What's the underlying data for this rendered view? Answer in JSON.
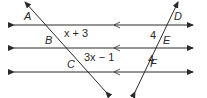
{
  "figure": {
    "points": {
      "A": "A",
      "B": "B",
      "C": "C",
      "D": "D",
      "E": "E",
      "F": "F"
    },
    "segments": {
      "AB_to_BC": "x + 3",
      "BC": "3x − 1",
      "DE": "4",
      "EF": "4"
    },
    "colors": {
      "line": "#2a2a2a",
      "background": "#ffffff"
    }
  }
}
